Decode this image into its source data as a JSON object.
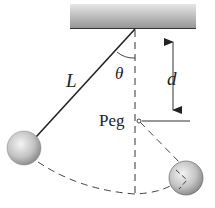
{
  "diagram": {
    "type": "pendulum-with-peg",
    "labels": {
      "length": "L",
      "angle": "θ",
      "distance": "d",
      "peg": "Peg"
    },
    "colors": {
      "ceiling_top": "#e4e4e4",
      "ceiling_bottom": "#9a9a9a",
      "line": "#222222",
      "ball_light": "#f2f2f2",
      "ball_dark": "#8c8c8c"
    }
  }
}
